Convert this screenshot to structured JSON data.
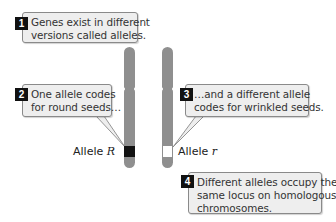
{
  "callouts": [
    {
      "number": "1",
      "lines": [
        "Genes exist in different",
        "versions called alleles."
      ]
    },
    {
      "number": "2",
      "lines": [
        "One allele codes",
        "for round seeds…"
      ]
    },
    {
      "number": "3",
      "lines": [
        "…and a different allele",
        "codes for wrinkled seeds."
      ]
    },
    {
      "number": "4",
      "lines": [
        "Different alleles occupy the",
        "same locus on homologous",
        "chromosomes."
      ]
    }
  ],
  "alleles": {
    "left": {
      "prefix": "Allele ",
      "symbol": "R",
      "band_color": "#111111"
    },
    "right": {
      "prefix": "Allele ",
      "symbol": "r",
      "band_color": "#ffffff"
    }
  },
  "colors": {
    "chromosome": "#8f8f8f",
    "callout_bg": "#eeeeee",
    "callout_border": "#8a8a8a",
    "badge_bg": "#111111"
  }
}
